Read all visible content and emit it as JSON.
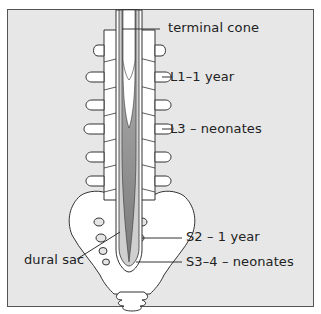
{
  "figure": {
    "colors": {
      "background": "#e7e7e7",
      "border": "#555555",
      "bone": "#ffffff",
      "outline": "#333333",
      "dural_sac_fill": "#c9c9c9",
      "cord_fill_dark": "#8e8e8e"
    },
    "labels": {
      "terminal_cone": "terminal cone",
      "l1_year": "L1–1 year",
      "l3_neonates": "L3 – neonates",
      "s2_year": "S2 – 1 year",
      "dural_sac": "dural sac",
      "s34_neonates": "S3–4 – neonates"
    }
  }
}
